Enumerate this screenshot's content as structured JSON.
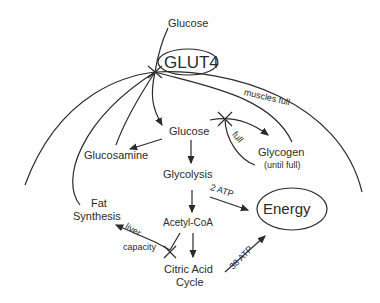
{
  "diagram": {
    "nodes": {
      "glucose_outside": "Glucose",
      "glut4": "GLUT4",
      "glucose_inside": "Glucose",
      "glucosamine": "Glucosamine",
      "glycogen": "Glycogen",
      "glycogen_note": "(until full)",
      "glycolysis": "Glycolysis",
      "fat_synthesis_1": "Fat",
      "fat_synthesis_2": "Synthesis",
      "acetyl_coa": "Acetyl-CoA",
      "citric_acid_1": "Citric Acid",
      "citric_acid_2": "Cycle",
      "energy": "Energy"
    },
    "edge_labels": {
      "muscles_full": "muscles full",
      "full": "full",
      "atp_2": "2 ATP",
      "atp_38": "38 ATP",
      "liver": "liver",
      "capacity": "capacity"
    },
    "colors": {
      "stroke": "#2b2b2b",
      "background": "#ffffff"
    }
  }
}
